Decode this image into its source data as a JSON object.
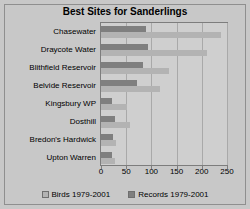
{
  "chart_data": {
    "type": "bar",
    "orientation": "horizontal",
    "title": "Best Sites for Sanderlings",
    "xlabel": "",
    "ylabel": "",
    "xlim": [
      0,
      250
    ],
    "xticks": [
      0,
      50,
      100,
      150,
      200,
      250
    ],
    "grid": true,
    "legend_position": "bottom",
    "categories": [
      "Chasewater",
      "Draycote Water",
      "Blithfield Reservoir",
      "Belvide Reservoir",
      "Kingsbury WP",
      "Dosthill",
      "Bredon's Hardwick",
      "Upton Warren"
    ],
    "series": [
      {
        "name": "Birds 1979-2001",
        "color": "#b3b3b3",
        "values": [
          238,
          211,
          135,
          117,
          52,
          57,
          30,
          27
        ]
      },
      {
        "name": "Records 1979-2001",
        "color": "#7f7f7f",
        "values": [
          90,
          94,
          84,
          72,
          22,
          27,
          23,
          21
        ]
      }
    ]
  },
  "colors": {
    "background": "#c8c8c8",
    "plot_background": "#cfcfcf",
    "frame_border": "#8f8f8f",
    "gridline": "#a9a9a9",
    "birds": "#b3b3b3",
    "records": "#7f7f7f"
  }
}
